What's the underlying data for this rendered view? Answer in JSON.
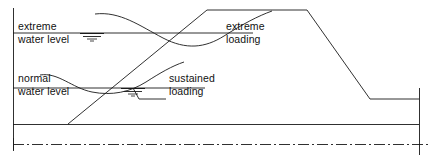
{
  "diagram": {
    "type": "engineering-cross-section",
    "colors": {
      "line": "#1a1a1a",
      "background": "#ffffff"
    },
    "labels": {
      "extreme_water_level": {
        "line1": "extreme",
        "line2": "water level"
      },
      "normal_water_level": {
        "line1": "normal",
        "line2": "water level"
      },
      "extreme_loading": {
        "line1": "extreme",
        "line2": "loading"
      },
      "sustained_loading": {
        "line1": "sustained",
        "line2": "loading"
      }
    },
    "icons": {
      "extreme_water_table_symbol": "water-table-icon",
      "normal_water_table_symbol": "water-table-icon"
    },
    "geometry": {
      "left_datum_line_x": 13,
      "ground_line_y": 124,
      "centerline_y": 144,
      "crest_top_y": 10,
      "crest_left_x": 207,
      "crest_right_x": 307,
      "upstream_toe_x": 68,
      "downstream_toe_x": 370,
      "downstream_toe_y": 99,
      "extreme_water_level_y": 33,
      "normal_water_level_y": 88,
      "berm_notch_left_x": 133,
      "berm_notch_bottom_y": 99,
      "berm_notch_right_x": 166
    }
  }
}
